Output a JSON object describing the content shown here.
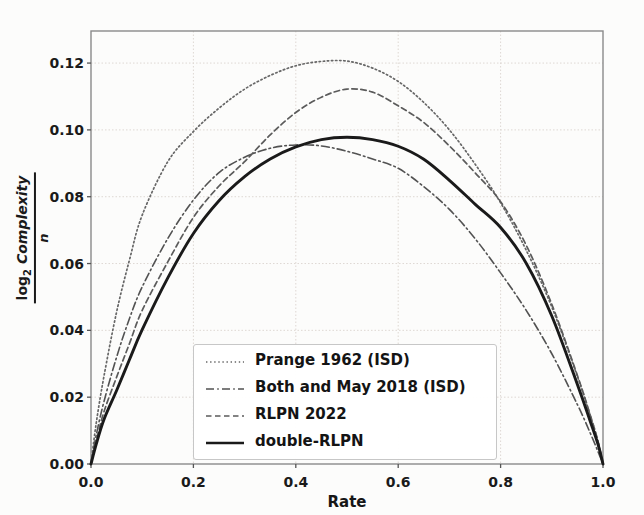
{
  "figure": {
    "background": "#fcfcfb",
    "frame_color": "#8a8a8a",
    "grid_color": "#ded8d3",
    "tick_color": "#555555",
    "text_color": "#1a1a1a"
  },
  "chart_data": {
    "type": "line",
    "title": "",
    "xlabel": "Rate",
    "ylabel": {
      "numerator_prefix": "log",
      "numerator_sub": "2",
      "numerator_main": "Complexity",
      "denominator": "n"
    },
    "xlim": [
      0,
      1
    ],
    "ylim": [
      0,
      0.1296
    ],
    "grid": true,
    "legend_position": "lower center",
    "xticks": {
      "values": [
        0.0,
        0.2,
        0.4,
        0.6,
        0.8,
        1.0
      ],
      "labels": [
        "0.0",
        "0.2",
        "0.4",
        "0.6",
        "0.8",
        "1.0"
      ]
    },
    "yticks": {
      "values": [
        0.0,
        0.02,
        0.04,
        0.06,
        0.08,
        0.1,
        0.12
      ],
      "labels": [
        "0.00",
        "0.02",
        "0.04",
        "0.06",
        "0.08",
        "0.10",
        "0.12"
      ]
    },
    "series": [
      {
        "name": "Prange 1962 (ISD)",
        "linestyle": "dotted",
        "color": "#676767",
        "width": 1.7,
        "peak": {
          "x": 0.47,
          "y": 0.1206
        },
        "points": [
          [
            0,
            0
          ],
          [
            0.01,
            0.012
          ],
          [
            0.025,
            0.026
          ],
          [
            0.05,
            0.0455
          ],
          [
            0.075,
            0.061
          ],
          [
            0.1,
            0.0745
          ],
          [
            0.15,
            0.0905
          ],
          [
            0.2,
            0.0995
          ],
          [
            0.25,
            0.1065
          ],
          [
            0.3,
            0.1122
          ],
          [
            0.35,
            0.1163
          ],
          [
            0.4,
            0.1192
          ],
          [
            0.45,
            0.1205
          ],
          [
            0.5,
            0.1206
          ],
          [
            0.55,
            0.1185
          ],
          [
            0.6,
            0.1145
          ],
          [
            0.65,
            0.1082
          ],
          [
            0.7,
            0.1
          ],
          [
            0.75,
            0.0898
          ],
          [
            0.8,
            0.0782
          ],
          [
            0.85,
            0.064
          ],
          [
            0.9,
            0.047
          ],
          [
            0.95,
            0.0262
          ],
          [
            0.975,
            0.0145
          ],
          [
            0.99,
            0.0068
          ],
          [
            1,
            0
          ]
        ]
      },
      {
        "name": "Both and May 2018 (ISD)",
        "linestyle": "dashdot",
        "color": "#525252",
        "width": 1.6,
        "peak": {
          "x": 0.41,
          "y": 0.0955
        },
        "points": [
          [
            0,
            0
          ],
          [
            0.01,
            0.0085
          ],
          [
            0.025,
            0.0185
          ],
          [
            0.05,
            0.032
          ],
          [
            0.075,
            0.0435
          ],
          [
            0.1,
            0.053
          ],
          [
            0.15,
            0.0675
          ],
          [
            0.2,
            0.079
          ],
          [
            0.25,
            0.0872
          ],
          [
            0.3,
            0.0918
          ],
          [
            0.35,
            0.0945
          ],
          [
            0.4,
            0.0955
          ],
          [
            0.45,
            0.0952
          ],
          [
            0.5,
            0.0936
          ],
          [
            0.55,
            0.0913
          ],
          [
            0.6,
            0.0885
          ],
          [
            0.65,
            0.083
          ],
          [
            0.7,
            0.0762
          ],
          [
            0.75,
            0.0675
          ],
          [
            0.8,
            0.0572
          ],
          [
            0.85,
            0.046
          ],
          [
            0.9,
            0.033
          ],
          [
            0.95,
            0.0178
          ],
          [
            0.975,
            0.0093
          ],
          [
            0.99,
            0.0038
          ],
          [
            1,
            0
          ]
        ]
      },
      {
        "name": "RLPN 2022",
        "linestyle": "dashed",
        "color": "#5b5b5b",
        "width": 1.7,
        "peak": {
          "x": 0.5,
          "y": 0.1122
        },
        "points": [
          [
            0,
            0
          ],
          [
            0.01,
            0.0068
          ],
          [
            0.025,
            0.0155
          ],
          [
            0.05,
            0.026
          ],
          [
            0.075,
            0.036
          ],
          [
            0.1,
            0.046
          ],
          [
            0.15,
            0.0605
          ],
          [
            0.2,
            0.0738
          ],
          [
            0.25,
            0.0832
          ],
          [
            0.3,
            0.0905
          ],
          [
            0.35,
            0.0985
          ],
          [
            0.4,
            0.1052
          ],
          [
            0.45,
            0.1098
          ],
          [
            0.5,
            0.1122
          ],
          [
            0.55,
            0.1113
          ],
          [
            0.6,
            0.1072
          ],
          [
            0.65,
            0.1022
          ],
          [
            0.7,
            0.0952
          ],
          [
            0.75,
            0.0872
          ],
          [
            0.8,
            0.0785
          ],
          [
            0.85,
            0.0655
          ],
          [
            0.9,
            0.0478
          ],
          [
            0.95,
            0.0265
          ],
          [
            0.975,
            0.0147
          ],
          [
            0.99,
            0.007
          ],
          [
            1,
            0
          ]
        ]
      },
      {
        "name": "double-RLPN",
        "linestyle": "solid",
        "color": "#1a1a1a",
        "width": 2.9,
        "peak": {
          "x": 0.5,
          "y": 0.0978
        },
        "points": [
          [
            0,
            0
          ],
          [
            0.01,
            0.0058
          ],
          [
            0.025,
            0.0132
          ],
          [
            0.05,
            0.022
          ],
          [
            0.075,
            0.0312
          ],
          [
            0.1,
            0.0402
          ],
          [
            0.15,
            0.0557
          ],
          [
            0.2,
            0.069
          ],
          [
            0.25,
            0.0788
          ],
          [
            0.3,
            0.086
          ],
          [
            0.35,
            0.0913
          ],
          [
            0.4,
            0.0949
          ],
          [
            0.45,
            0.0971
          ],
          [
            0.5,
            0.0978
          ],
          [
            0.55,
            0.0971
          ],
          [
            0.6,
            0.0951
          ],
          [
            0.65,
            0.0912
          ],
          [
            0.7,
            0.0849
          ],
          [
            0.75,
            0.0778
          ],
          [
            0.8,
            0.0708
          ],
          [
            0.85,
            0.0601
          ],
          [
            0.9,
            0.0443
          ],
          [
            0.95,
            0.0238
          ],
          [
            0.975,
            0.0128
          ],
          [
            0.99,
            0.006
          ],
          [
            1,
            0
          ]
        ]
      }
    ]
  }
}
